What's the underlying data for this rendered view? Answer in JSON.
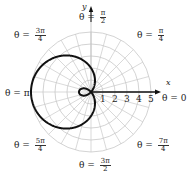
{
  "chart_data": {
    "type": "line",
    "subtype": "polar",
    "equation": "r = 2 - 3cos(theta)",
    "title": "",
    "xlabel": "x",
    "ylabel": "y",
    "radial_ticks": [
      "1",
      "2",
      "3",
      "4",
      "5"
    ],
    "rlim": [
      0,
      5
    ],
    "grid": true,
    "grid_angle_step_deg": 15,
    "angle_labels": [
      {
        "id": "a0",
        "prefix": "θ = ",
        "value": "0"
      },
      {
        "id": "a1",
        "prefix": "θ = ",
        "num": "π",
        "den": "4"
      },
      {
        "id": "a2",
        "prefix": "θ = ",
        "num": "π",
        "den": "2"
      },
      {
        "id": "a3",
        "prefix": "θ = ",
        "num": "3π",
        "den": "4"
      },
      {
        "id": "a4",
        "prefix": "θ = ",
        "value": "π"
      },
      {
        "id": "a5",
        "prefix": "θ = ",
        "num": "5π",
        "den": "4"
      },
      {
        "id": "a6",
        "prefix": "θ = ",
        "num": "3π",
        "den": "2"
      },
      {
        "id": "a7",
        "prefix": "θ = ",
        "num": "7π",
        "den": "4"
      }
    ],
    "key_points": [
      {
        "theta": "0",
        "r": -1
      },
      {
        "theta": "π/2",
        "r": 2
      },
      {
        "theta": "π",
        "r": 5
      },
      {
        "theta": "3π/2",
        "r": 2
      }
    ],
    "colors": {
      "curve": "#111111",
      "grid": "#c8c8c8",
      "axis": "#111111"
    }
  }
}
